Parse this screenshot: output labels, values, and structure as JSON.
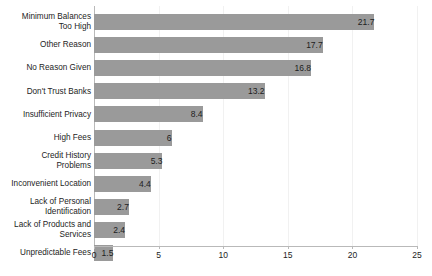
{
  "chart_data": {
    "type": "bar",
    "orientation": "horizontal",
    "title": "",
    "subtitle": "",
    "xlabel": "",
    "ylabel": "",
    "xlim": [
      0,
      25
    ],
    "xticks": [
      0,
      5,
      10,
      15,
      20,
      25
    ],
    "xtick_labels": [
      "0",
      "5",
      "10",
      "15",
      "20",
      "25"
    ],
    "grid": true,
    "grid_axis": "x",
    "legend": false,
    "legend_position": "none",
    "bar_color": "#9a9a9a",
    "gridline_color": "#f1f1f1",
    "axis_color": "#b9b9b9",
    "text_color": "#1d1d1d",
    "value_label_position": "inside-end",
    "categories": [
      "Minimum Balances\nToo High",
      "Other Reason",
      "No Reason Given",
      "Don't Trust Banks",
      "Insufficient Privacy",
      "High Fees",
      "Credit History\nProblems",
      "Inconvenient Location",
      "Lack of Personal\nIdentification",
      "Lack of Products and\nServices",
      "Unpredictable Fees"
    ],
    "values": [
      21.7,
      17.7,
      16.8,
      13.2,
      8.4,
      6,
      5.3,
      4.4,
      2.7,
      2.4,
      1.5
    ],
    "value_labels": [
      "21.7",
      "17.7",
      "16.8",
      "13.2",
      "8.4",
      "6",
      "5.3",
      "4.4",
      "2.7",
      "2.4",
      "1.5"
    ]
  }
}
